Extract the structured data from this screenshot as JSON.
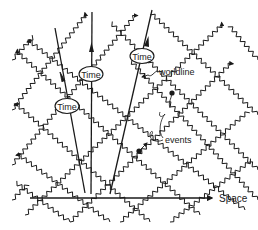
{
  "diagram": {
    "labels": {
      "time_1": "Time",
      "time_2": "Time",
      "time_3": "Time",
      "worldline": "worldline",
      "events": "events",
      "space": "Space"
    },
    "colors": {
      "ink": "#1a1a1a",
      "background": "#ffffff"
    }
  }
}
